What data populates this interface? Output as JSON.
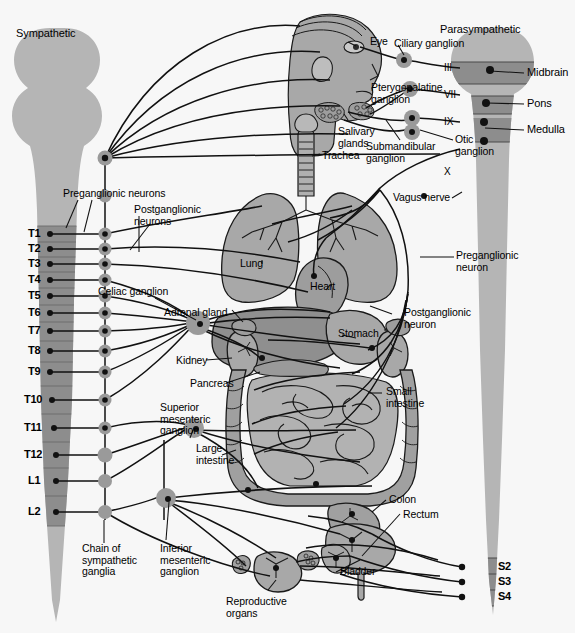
{
  "figure": {
    "type": "anatomical-diagram",
    "background_color": "#f7f7f7",
    "palette": {
      "cord_light": "#b5b5b5",
      "cord_dark": "#8d8d8d",
      "organ_mid": "#a8a8a8",
      "organ_dark": "#8f8f8f",
      "organ_light": "#c9c9c9",
      "line": "#111111",
      "ganglion": "#9a9a9a",
      "node": "#1a1a1a"
    }
  },
  "headings": {
    "sympathetic": "Sympathetic",
    "parasympathetic": "Parasympathetic"
  },
  "sympathetic": {
    "neuron_labels": {
      "preganglionic": "Preganglionic neurons",
      "postganglionic": "Postganglionic\nneurons"
    },
    "chain_label": "Chain of\nsympathetic\nganglia",
    "spinal_segments": [
      {
        "id": "T1",
        "label": "T1",
        "y": 234
      },
      {
        "id": "T2",
        "label": "T2",
        "y": 249
      },
      {
        "id": "T3",
        "label": "T3",
        "y": 264
      },
      {
        "id": "T4",
        "label": "T4",
        "y": 280
      },
      {
        "id": "T5",
        "label": "T5",
        "y": 296
      },
      {
        "id": "T6",
        "label": "T6",
        "y": 313
      },
      {
        "id": "T7",
        "label": "T7",
        "y": 331
      },
      {
        "id": "T8",
        "label": "T8",
        "y": 351
      },
      {
        "id": "T9",
        "label": "T9",
        "y": 372
      },
      {
        "id": "T10",
        "label": "T10",
        "y": 400
      },
      {
        "id": "T11",
        "label": "T11",
        "y": 428
      },
      {
        "id": "T12",
        "label": "T12",
        "y": 455
      },
      {
        "id": "L1",
        "label": "L1",
        "y": 481
      },
      {
        "id": "L2",
        "label": "L2",
        "y": 512
      }
    ],
    "ganglia": [
      {
        "id": "celiac",
        "label": "Celiac ganglion"
      },
      {
        "id": "superior-mesenteric",
        "label": "Superior\nmesenteric\nganglion"
      },
      {
        "id": "inferior-mesenteric",
        "label": "Inferior\nmesenteric\nganglion"
      }
    ]
  },
  "parasympathetic": {
    "brain_regions": [
      {
        "id": "midbrain",
        "label": "Midbrain",
        "y": 73
      },
      {
        "id": "pons",
        "label": "Pons",
        "y": 104
      },
      {
        "id": "medulla",
        "label": "Medulla",
        "y": 130
      }
    ],
    "cranial_nerves": [
      {
        "id": "III",
        "label": "III",
        "y": 68
      },
      {
        "id": "VII",
        "label": "VII",
        "y": 95
      },
      {
        "id": "IX",
        "label": "IX",
        "y": 122
      },
      {
        "id": "X",
        "label": "X",
        "y": 149
      }
    ],
    "sacral_segments": [
      {
        "id": "S2",
        "label": "S2",
        "y": 567
      },
      {
        "id": "S3",
        "label": "S3",
        "y": 582
      },
      {
        "id": "S4",
        "label": "S4",
        "y": 597
      }
    ],
    "neuron_labels": {
      "preganglionic": "Preganglionic\nneuron",
      "postganglionic": "Postganglionic\nneuron"
    },
    "vagus_label": "Vagus nerve",
    "head_ganglia": [
      {
        "id": "ciliary",
        "label": "Ciliary ganglion"
      },
      {
        "id": "pterygopalatine",
        "label": "Pterygopalatine\nganglion"
      },
      {
        "id": "submandibular",
        "label": "Submandibular\nganglion"
      },
      {
        "id": "otic",
        "label": "Otic\nganglion"
      }
    ]
  },
  "organs": [
    {
      "id": "eye",
      "label": "Eye"
    },
    {
      "id": "salivary-glands",
      "label": "Salivary\nglands"
    },
    {
      "id": "trachea",
      "label": "Trachea"
    },
    {
      "id": "lung",
      "label": "Lung"
    },
    {
      "id": "heart",
      "label": "Heart"
    },
    {
      "id": "stomach",
      "label": "Stomach"
    },
    {
      "id": "adrenal-gland",
      "label": "Adrenal gland"
    },
    {
      "id": "kidney",
      "label": "Kidney"
    },
    {
      "id": "pancreas",
      "label": "Pancreas"
    },
    {
      "id": "small-intestine",
      "label": "Small\nintestine"
    },
    {
      "id": "large-intestine",
      "label": "Large\nintestine"
    },
    {
      "id": "colon",
      "label": "Colon"
    },
    {
      "id": "rectum",
      "label": "Rectum"
    },
    {
      "id": "bladder",
      "label": "Bladder"
    },
    {
      "id": "reproductive-organs",
      "label": "Reproductive\norgans"
    }
  ]
}
